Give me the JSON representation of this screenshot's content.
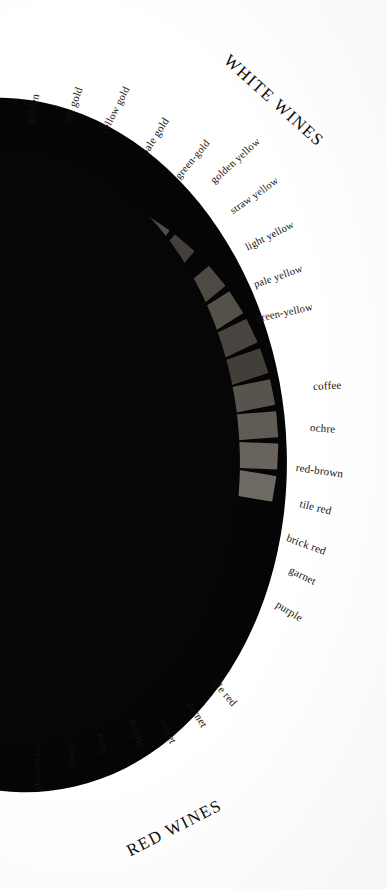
{
  "figure": {
    "kind": "wine-colour-wheel",
    "background_color": "#ffffff",
    "disc_color": "#050505",
    "label_color": "#15120f"
  },
  "sections": {
    "white": {
      "title": "WHITE WINES",
      "rotation_deg": 42
    },
    "red": {
      "title": "RED WINES",
      "rotation_deg": -27
    }
  },
  "chart_data": {
    "type": "pie",
    "legend": "outer radial labels",
    "categories": [
      "golden",
      "old gold",
      "yellow gold",
      "pale gold",
      "green-gold",
      "golden yellow",
      "straw yellow",
      "light yellow",
      "pale yellow",
      "green-yellow",
      "coffee",
      "ochre",
      "red-brown",
      "tile red",
      "brick red",
      "garnet",
      "purple",
      "tile red",
      "garnet",
      "violet",
      "purple",
      "ruby",
      "cherry",
      "strawberry",
      "peony"
    ],
    "series": [
      {
        "name": "swatch greyscale value",
        "values": [
          232,
          231,
          230,
          229,
          228,
          226,
          225,
          224,
          223,
          222,
          38,
          112,
          62,
          70,
          76,
          82,
          68,
          78,
          84,
          72,
          66,
          88,
          96,
          104,
          110
        ]
      }
    ]
  },
  "swatches": [
    {
      "label": "golden",
      "group": "white",
      "angle": -74.5,
      "color": "#e9e7dd"
    },
    {
      "label": "old gold",
      "group": "white",
      "angle": -67.5,
      "color": "#e9e7dc"
    },
    {
      "label": "yellow gold",
      "group": "white",
      "angle": -60.5,
      "color": "#e8e6da"
    },
    {
      "label": "pale gold",
      "group": "white",
      "angle": -53.5,
      "color": "#e8e5d8"
    },
    {
      "label": "green-gold",
      "group": "white",
      "angle": -46.5,
      "color": "#e9e6d9"
    },
    {
      "label": "golden yellow",
      "group": "white",
      "angle": -39.5,
      "color": "#e7e4d6"
    },
    {
      "label": "straw yellow",
      "group": "white",
      "angle": -32.5,
      "color": "#e6e3d4"
    },
    {
      "label": "light yellow",
      "group": "white",
      "angle": -25.5,
      "color": "#e5e2d3"
    },
    {
      "label": "pale yellow",
      "group": "white",
      "angle": -18.5,
      "color": "#e4e1d2"
    },
    {
      "label": "green-yellow",
      "group": "white",
      "angle": -11.5,
      "color": "#e3e0d1"
    },
    {
      "label": "coffee",
      "group": "red",
      "angle": 4.5,
      "color": "#282422"
    },
    {
      "label": "ochre",
      "group": "red",
      "angle": 11.5,
      "color": "#6f6a62"
    },
    {
      "label": "red-brown",
      "group": "red",
      "angle": 18.5,
      "color": "#3d3834"
    },
    {
      "label": "tile red",
      "group": "red",
      "angle": 25.5,
      "color": "#45403b"
    },
    {
      "label": "brick red",
      "group": "red",
      "angle": 32.5,
      "color": "#4b4641"
    },
    {
      "label": "garnet",
      "group": "red",
      "angle": 39.5,
      "color": "#514c46"
    },
    {
      "label": "purple",
      "group": "red",
      "angle": 46.5,
      "color": "#444039"
    },
    {
      "label": "tile red",
      "group": "red",
      "angle": 56.5,
      "color": "#4e4943"
    },
    {
      "label": "garnet",
      "group": "red",
      "angle": 63.5,
      "color": "#54504a"
    },
    {
      "label": "violet",
      "group": "red",
      "angle": 70.5,
      "color": "#48443f"
    },
    {
      "label": "purple",
      "group": "red",
      "angle": 77.5,
      "color": "#423e3a"
    },
    {
      "label": "ruby",
      "group": "red",
      "angle": 84.5,
      "color": "#58534d"
    },
    {
      "label": "cherry",
      "group": "red",
      "angle": 91.5,
      "color": "#605b55"
    },
    {
      "label": "strawberry",
      "group": "red",
      "angle": 98.5,
      "color": "#68635c"
    },
    {
      "label": "peony",
      "group": "red",
      "angle": 105.5,
      "color": "#6e6962"
    }
  ],
  "labels": [
    {
      "text": "golden",
      "x": 28,
      "y": 118,
      "rot": -76
    },
    {
      "text": "old gold",
      "x": 66,
      "y": 117,
      "rot": -70
    },
    {
      "text": "yellow gold",
      "x": 103,
      "y": 128,
      "rot": -63
    },
    {
      "text": "pale gold",
      "x": 143,
      "y": 148,
      "rot": -57
    },
    {
      "text": "green-gold",
      "x": 177,
      "y": 172,
      "rot": -50
    },
    {
      "text": "golden yellow",
      "x": 212,
      "y": 176,
      "rot": -42
    },
    {
      "text": "straw yellow",
      "x": 231,
      "y": 206,
      "rot": -35
    },
    {
      "text": "light yellow",
      "x": 246,
      "y": 242,
      "rot": -27
    },
    {
      "text": "pale yellow",
      "x": 254,
      "y": 279,
      "rot": -19
    },
    {
      "text": "green-yellow",
      "x": 256,
      "y": 313,
      "rot": -12
    },
    {
      "text": "coffee",
      "x": 313,
      "y": 380,
      "rot": -3
    },
    {
      "text": "ochre",
      "x": 310,
      "y": 421,
      "rot": 4
    },
    {
      "text": "red-brown",
      "x": 296,
      "y": 461,
      "rot": 8
    },
    {
      "text": "tile red",
      "x": 300,
      "y": 497,
      "rot": 14
    },
    {
      "text": "brick red",
      "x": 287,
      "y": 531,
      "rot": 20
    },
    {
      "text": "garnet",
      "x": 290,
      "y": 563,
      "rot": 26
    },
    {
      "text": "purple",
      "x": 277,
      "y": 597,
      "rot": 32
    },
    {
      "text": "tile red",
      "x": 214,
      "y": 674,
      "rot": 49
    },
    {
      "text": "garnet",
      "x": 190,
      "y": 696,
      "rot": 58
    },
    {
      "text": "violet",
      "x": 163,
      "y": 713,
      "rot": 65
    },
    {
      "text": "purple",
      "x": 133,
      "y": 713,
      "rot": 72
    },
    {
      "text": "ruby",
      "x": 101,
      "y": 728,
      "rot": 78
    },
    {
      "text": "cherry",
      "x": 72,
      "y": 735,
      "rot": 84
    },
    {
      "text": "strawberry",
      "x": 38,
      "y": 740,
      "rot": 90
    },
    {
      "text": "peony",
      "x": -2,
      "y": 745,
      "rot": 95
    }
  ]
}
